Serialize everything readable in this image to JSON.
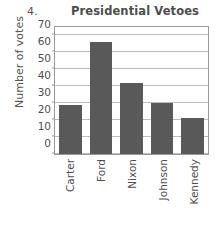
{
  "problem": {
    "number": "4."
  },
  "chart_data": {
    "type": "bar",
    "title": "Presidential Vetoes",
    "xlabel": "",
    "ylabel": "Number of votes",
    "categories": [
      "Carter",
      "Ford",
      "Nixon",
      "Johnson",
      "Kennedy"
    ],
    "values": [
      29,
      66,
      42,
      30,
      21
    ],
    "ylim": [
      0,
      75
    ],
    "yticks": [
      0,
      10,
      20,
      30,
      40,
      50,
      60,
      70
    ],
    "ytick_labels": [
      "0",
      "10",
      "20",
      "30",
      "40",
      "50",
      "60",
      "70"
    ],
    "grid": true,
    "legend": null,
    "bar_color": "#595959",
    "frame_color": "#9a9a9a",
    "gridline_color": "#bdbdbd"
  }
}
